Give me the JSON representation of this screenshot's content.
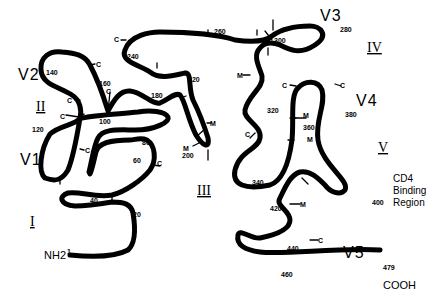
{
  "diagram": {
    "type": "protein-secondary-structure-schematic",
    "termini": {
      "n_terminus": "NH2",
      "c_terminus": "COOH",
      "start_residue": "1",
      "end_residue": "479"
    },
    "variable_regions": [
      "V1",
      "V2",
      "V3",
      "V4",
      "V5"
    ],
    "constant_regions": [
      "I",
      "II",
      "III",
      "IV",
      "V"
    ],
    "annotation": {
      "line1": "CD4",
      "line2": "Binding",
      "line3": "Region"
    },
    "residue_numbers": [
      "1",
      "20",
      "40",
      "60",
      "80",
      "100",
      "120",
      "140",
      "160",
      "180",
      "200",
      "220",
      "240",
      "260",
      "280",
      "300",
      "320",
      "340",
      "360",
      "380",
      "400",
      "420",
      "440",
      "460",
      "479"
    ],
    "site_markers": {
      "cysteine": "C",
      "glycosylation": "M"
    }
  }
}
